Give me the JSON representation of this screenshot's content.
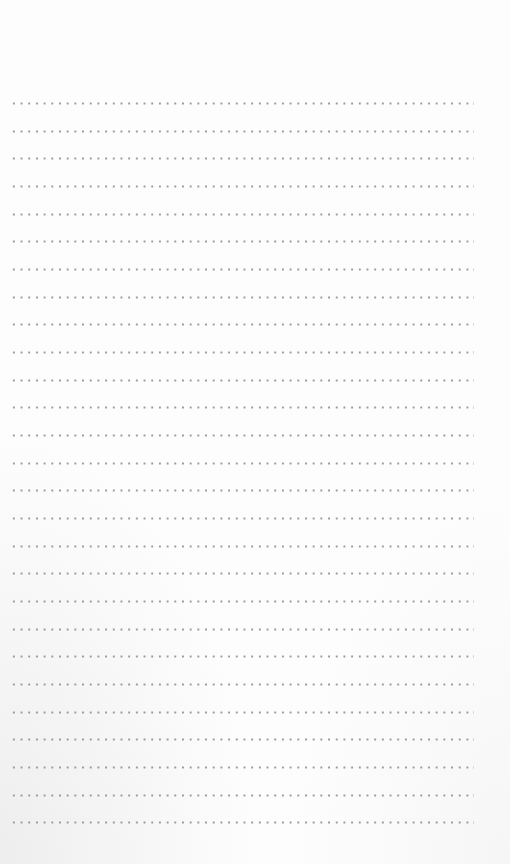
{
  "page": {
    "type": "blank dotted ruled notepad page",
    "background_color": "#fdfdfd",
    "dot_color": "#9a9a9a",
    "line_count": 27,
    "first_line_y": 102,
    "line_spacing_px": 27.66,
    "line_left_x": 10,
    "line_width_px": 462
  },
  "lines": []
}
